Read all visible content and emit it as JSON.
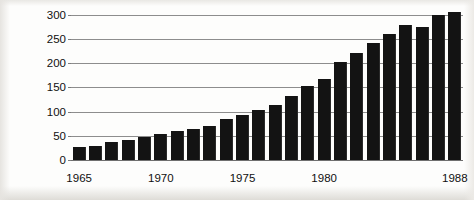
{
  "figure": {
    "name": "index-bar-chart",
    "background_color": "#fdfdfc",
    "bar_color": "#131313",
    "gridline_color": "#8d8d8d",
    "text_color": "#101010"
  },
  "chart_data": {
    "type": "bar",
    "title": "",
    "xlabel": "",
    "ylabel": "Index: 1975 = 100",
    "ylim": [
      0,
      310
    ],
    "yticks": [
      0,
      50,
      100,
      150,
      200,
      250,
      300
    ],
    "ytick_labels": [
      "0",
      "50",
      "100",
      "150",
      "200",
      "250",
      "300"
    ],
    "grid": true,
    "legend": null,
    "categories": [
      "1965",
      "1966",
      "1967",
      "1968",
      "1969",
      "1970",
      "1971",
      "1972",
      "1973",
      "1974",
      "1975",
      "1976",
      "1977",
      "1978",
      "1979",
      "1980",
      "1981",
      "1982",
      "1983",
      "1984",
      "1985",
      "1986",
      "1987",
      "1988"
    ],
    "values": [
      26,
      28,
      38,
      41,
      48,
      54,
      59,
      65,
      70,
      84,
      94,
      103,
      114,
      133,
      152,
      167,
      202,
      221,
      241,
      261,
      279,
      275,
      299,
      305
    ],
    "xtick_labels": [
      "1965",
      "1970",
      "1975",
      "1980",
      "1988"
    ],
    "xtick_categories": [
      "1965",
      "1970",
      "1975",
      "1980",
      "1988"
    ]
  }
}
